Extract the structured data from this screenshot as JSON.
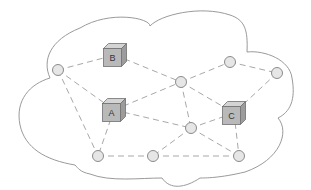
{
  "diagram": {
    "type": "network-cloud",
    "colors": {
      "cloud_stroke": "#9a9a9a",
      "link": "#a8a8a8",
      "node_fill": "#e6e6e6",
      "cube_front": "#b9b9b9"
    },
    "devices": [
      {
        "id": "B",
        "label": "B",
        "x": 115,
        "y": 55
      },
      {
        "id": "A",
        "label": "A",
        "x": 114,
        "y": 110
      },
      {
        "id": "C",
        "label": "C",
        "x": 234,
        "y": 113
      }
    ],
    "nodes": [
      {
        "id": "n1",
        "x": 58,
        "y": 70
      },
      {
        "id": "n2",
        "x": 181,
        "y": 82
      },
      {
        "id": "n3",
        "x": 230,
        "y": 62
      },
      {
        "id": "n4",
        "x": 277,
        "y": 73
      },
      {
        "id": "n5",
        "x": 191,
        "y": 128
      },
      {
        "id": "n6",
        "x": 98,
        "y": 156
      },
      {
        "id": "n7",
        "x": 153,
        "y": 156
      },
      {
        "id": "n8",
        "x": 239,
        "y": 156
      }
    ],
    "links": [
      [
        "n1",
        "B"
      ],
      [
        "n1",
        "A"
      ],
      [
        "n1",
        "n6"
      ],
      [
        "B",
        "n2"
      ],
      [
        "A",
        "n2"
      ],
      [
        "A",
        "n6"
      ],
      [
        "A",
        "n5"
      ],
      [
        "n2",
        "n3"
      ],
      [
        "n2",
        "n5"
      ],
      [
        "n2",
        "C"
      ],
      [
        "n3",
        "n4"
      ],
      [
        "n4",
        "C"
      ],
      [
        "C",
        "n5"
      ],
      [
        "C",
        "n8"
      ],
      [
        "n5",
        "n7"
      ],
      [
        "n5",
        "n8"
      ],
      [
        "n6",
        "n7"
      ],
      [
        "n7",
        "n8"
      ]
    ]
  }
}
